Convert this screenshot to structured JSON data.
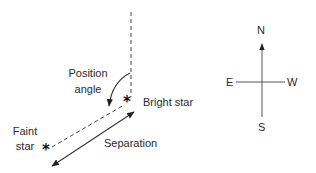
{
  "diagram": {
    "labels": {
      "position_angle_line1": "Position",
      "position_angle_line2": "angle",
      "bright_star": "Bright star",
      "faint_star_line1": "Faint",
      "faint_star_line2": "star",
      "separation": "Separation"
    },
    "compass": {
      "north": "N",
      "east": "E",
      "west": "W",
      "south": "S"
    },
    "glyphs": {
      "bright_star_marker": "*",
      "faint_star_marker": "*"
    },
    "colors": {
      "line": "#333333",
      "text": "#2a2a2a",
      "background": "#ffffff"
    }
  }
}
